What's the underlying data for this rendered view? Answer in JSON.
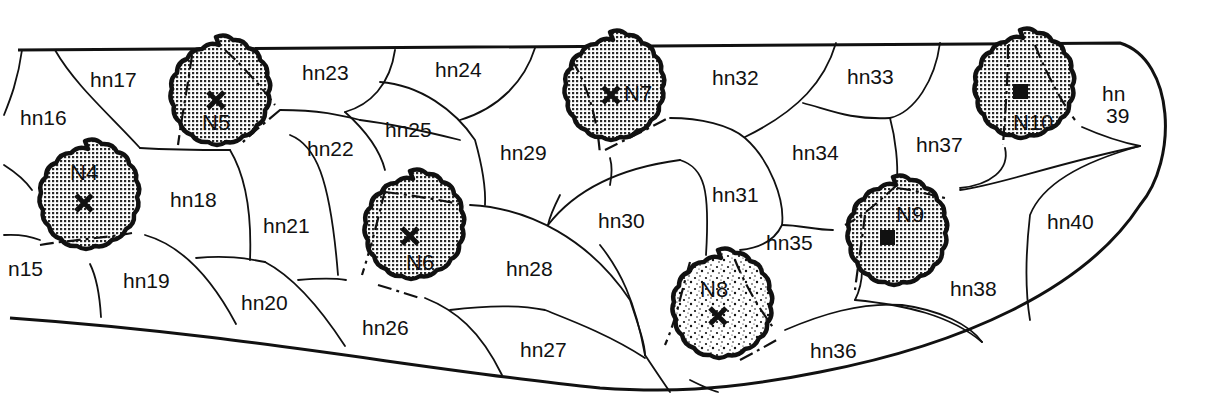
{
  "diagram": {
    "type": "node-region-map",
    "colors": {
      "ink": "#111111",
      "background": "#ffffff",
      "stipple": "#2a2a2a"
    },
    "nodes": [
      {
        "id": "N4",
        "label": "N4",
        "cx": 85,
        "cy": 202,
        "r": 62,
        "pattern": "fine-grid",
        "marker": "cross"
      },
      {
        "id": "N5",
        "label": "N5",
        "cx": 216,
        "cy": 100,
        "r": 63,
        "pattern": "fine-grid",
        "marker": "cross"
      },
      {
        "id": "N6",
        "label": "N6",
        "cx": 410,
        "cy": 235,
        "r": 64,
        "pattern": "fine-grid",
        "marker": "cross"
      },
      {
        "id": "N7",
        "label": "N7",
        "cx": 610,
        "cy": 95,
        "r": 63,
        "pattern": "fine-grid",
        "marker": "cross"
      },
      {
        "id": "N8",
        "label": "N8",
        "cx": 718,
        "cy": 316,
        "r": 66,
        "pattern": "coarse-dots",
        "marker": "cross"
      },
      {
        "id": "N9",
        "label": "N9",
        "cx": 893,
        "cy": 240,
        "r": 63,
        "pattern": "fine-grid",
        "marker": "square"
      },
      {
        "id": "N10",
        "label": "N10",
        "cx": 1020,
        "cy": 93,
        "r": 63,
        "pattern": "fine-grid",
        "marker": "square"
      }
    ],
    "regions": [
      {
        "id": "hn15",
        "label": "n15",
        "x": 8,
        "y": 276
      },
      {
        "id": "hn16",
        "label": "hn16",
        "x": 20,
        "y": 125
      },
      {
        "id": "hn17",
        "label": "hn17",
        "x": 90,
        "y": 87
      },
      {
        "id": "hn18",
        "label": "hn18",
        "x": 170,
        "y": 207
      },
      {
        "id": "hn19",
        "label": "hn19",
        "x": 123,
        "y": 288
      },
      {
        "id": "hn20",
        "label": "hn20",
        "x": 241,
        "y": 310
      },
      {
        "id": "hn21",
        "label": "hn21",
        "x": 263,
        "y": 233
      },
      {
        "id": "hn22",
        "label": "hn22",
        "x": 307,
        "y": 156
      },
      {
        "id": "hn23",
        "label": "hn23",
        "x": 302,
        "y": 80
      },
      {
        "id": "hn24",
        "label": "hn24",
        "x": 435,
        "y": 77
      },
      {
        "id": "hn25",
        "label": "hn25",
        "x": 385,
        "y": 137
      },
      {
        "id": "hn26",
        "label": "hn26",
        "x": 362,
        "y": 335
      },
      {
        "id": "hn27",
        "label": "hn27",
        "x": 520,
        "y": 357
      },
      {
        "id": "hn28",
        "label": "hn28",
        "x": 506,
        "y": 276
      },
      {
        "id": "hn29",
        "label": "hn29",
        "x": 500,
        "y": 160
      },
      {
        "id": "hn30",
        "label": "hn30",
        "x": 598,
        "y": 228
      },
      {
        "id": "hn31",
        "label": "hn31",
        "x": 712,
        "y": 202
      },
      {
        "id": "hn32",
        "label": "hn32",
        "x": 712,
        "y": 85
      },
      {
        "id": "hn33",
        "label": "hn33",
        "x": 847,
        "y": 84
      },
      {
        "id": "hn34",
        "label": "hn34",
        "x": 792,
        "y": 160
      },
      {
        "id": "hn35",
        "label": "hn35",
        "x": 766,
        "y": 250
      },
      {
        "id": "hn36",
        "label": "hn36",
        "x": 810,
        "y": 358
      },
      {
        "id": "hn37",
        "label": "hn37",
        "x": 916,
        "y": 152
      },
      {
        "id": "hn38",
        "label": "hn38",
        "x": 950,
        "y": 296
      },
      {
        "id": "hn39",
        "label": "hn",
        "label2": "39",
        "x": 1102,
        "y": 101
      },
      {
        "id": "hn40",
        "label": "hn40",
        "x": 1047,
        "y": 229
      }
    ]
  }
}
